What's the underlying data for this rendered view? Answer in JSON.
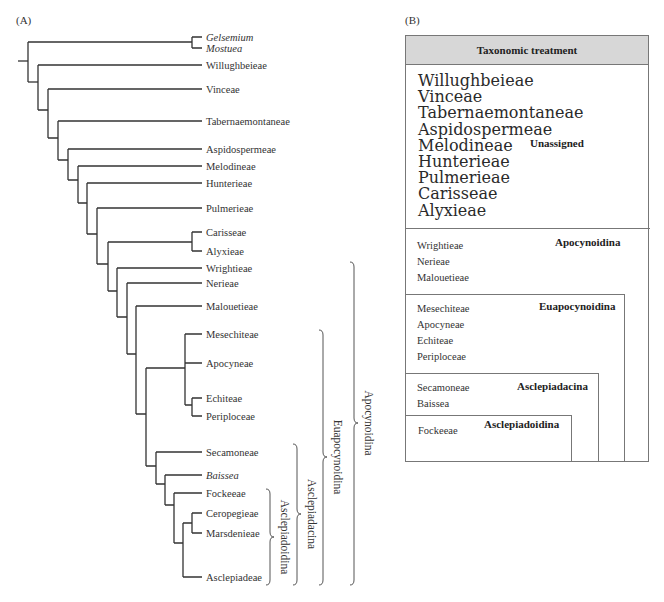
{
  "panelA": {
    "label": "(A)",
    "leaves": [
      {
        "name": "Gelsemium",
        "italic": true,
        "y": 37
      },
      {
        "name": "Mostuea",
        "italic": true,
        "y": 48
      },
      {
        "name": "Willughbeieae",
        "italic": false,
        "y": 65
      },
      {
        "name": "Vinceae",
        "italic": false,
        "y": 89
      },
      {
        "name": "Tabernaemontaneae",
        "italic": false,
        "y": 121
      },
      {
        "name": "Aspidospermeae",
        "italic": false,
        "y": 149
      },
      {
        "name": "Melodineae",
        "italic": false,
        "y": 166
      },
      {
        "name": "Hunterieae",
        "italic": false,
        "y": 183
      },
      {
        "name": "Pulmerieae",
        "italic": false,
        "y": 208
      },
      {
        "name": "Carisseae",
        "italic": false,
        "y": 232
      },
      {
        "name": "Alyxieae",
        "italic": false,
        "y": 251
      },
      {
        "name": "Wrightieae",
        "italic": false,
        "y": 268
      },
      {
        "name": "Nerieae",
        "italic": false,
        "y": 283
      },
      {
        "name": "Malouetieae",
        "italic": false,
        "y": 306
      },
      {
        "name": "Mesechiteae",
        "italic": false,
        "y": 334
      },
      {
        "name": "Apocyneae",
        "italic": false,
        "y": 363
      },
      {
        "name": "Echiteae",
        "italic": false,
        "y": 398
      },
      {
        "name": "Periploceae",
        "italic": false,
        "y": 416
      },
      {
        "name": "Secamoneae",
        "italic": false,
        "y": 452
      },
      {
        "name": "Baissea",
        "italic": true,
        "y": 475
      },
      {
        "name": "Fockeeae",
        "italic": false,
        "y": 493
      },
      {
        "name": "Ceropegieae",
        "italic": false,
        "y": 513
      },
      {
        "name": "Marsdenieae",
        "italic": false,
        "y": 533
      },
      {
        "name": "Asclepiadeae",
        "italic": false,
        "y": 577
      }
    ],
    "braces": [
      {
        "label": "Asclepiadoidina",
        "top": 489,
        "bottom": 585,
        "x": 270
      },
      {
        "label": "Asclepiadacina",
        "top": 444,
        "bottom": 585,
        "x": 297
      },
      {
        "label": "Euapocynoidina",
        "top": 330,
        "bottom": 585,
        "x": 323
      },
      {
        "label": "Apocynoidina",
        "top": 262,
        "bottom": 585,
        "x": 354
      }
    ]
  },
  "panelB": {
    "label": "(B)",
    "header": "Taxonomic treatment",
    "groups": [
      {
        "title": "Unassigned",
        "members": [
          "Willughbeieae",
          "Vinceae",
          "Tabernaemontaneae",
          "Aspidospermeae",
          "Melodineae",
          "Hunterieae",
          "Pulmerieae",
          "Carisseae",
          "Alyxieae"
        ]
      },
      {
        "title": "Apocynoidina",
        "members": [
          "Wrightieae",
          "Nerieae",
          "Malouetieae"
        ]
      },
      {
        "title": "Euapocynoidina",
        "members": [
          "Mesechiteae",
          "Apocyneae",
          "Echiteae",
          "Periploceae"
        ]
      },
      {
        "title": "Asclepiadacina",
        "members": [
          "Secamoneae",
          "Baissea"
        ]
      },
      {
        "title": "Asclepiadoidina",
        "members": [
          "Fockeeae",
          "Ceropegieae",
          "Marsdenieae",
          "Asclepiadeae"
        ]
      }
    ]
  }
}
